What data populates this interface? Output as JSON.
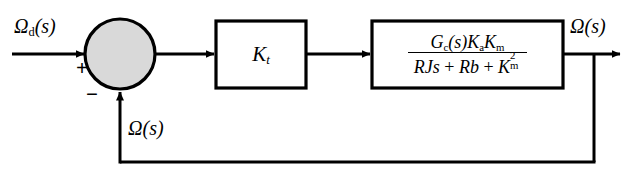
{
  "diagram": {
    "background_color": "#ffffff",
    "line_color": "#000000",
    "summing_junction_fill": "#d9d9d9"
  },
  "signals": {
    "input": {
      "name": "Omega_d(s)",
      "omega": "Ω",
      "subscript": "d",
      "arg": "(s)"
    },
    "output": {
      "name": "Omega(s)",
      "omega": "Ω",
      "arg": "(s)"
    },
    "feedback": {
      "name": "Omega(s)",
      "omega": "Ω",
      "arg": "(s)"
    }
  },
  "summing_junction": {
    "name": "summing-junction",
    "positive_sign": "+",
    "negative_sign": "−",
    "input_port_sign": "+",
    "feedback_port_sign": "−"
  },
  "blocks": [
    {
      "id": "gain",
      "label_main": "K",
      "label_sub": "t",
      "full_label": "K_t"
    },
    {
      "id": "transfer_function",
      "numerator": {
        "parts": [
          {
            "text": "G",
            "style": "italic"
          },
          {
            "text": "c",
            "style": "sub"
          },
          {
            "text": "(s)",
            "style": "italic"
          },
          {
            "text": "K",
            "style": "italic"
          },
          {
            "text": "a",
            "style": "sub"
          },
          {
            "text": "K",
            "style": "italic"
          },
          {
            "text": "m",
            "style": "sub"
          }
        ],
        "plain": "G_c(s)K_a K_m"
      },
      "denominator": {
        "parts": [
          {
            "text": "RJs",
            "style": "italic"
          },
          {
            "text": " + ",
            "style": "roman"
          },
          {
            "text": "Rb",
            "style": "italic"
          },
          {
            "text": " + ",
            "style": "roman"
          },
          {
            "text": "K",
            "style": "italic"
          },
          {
            "text": "m",
            "style": "sub"
          },
          {
            "text": "2",
            "style": "sup"
          }
        ],
        "plain": "RJs + Rb + K_m^2"
      },
      "full_label": "(G_c(s)K_a K_m) / (RJs + Rb + K_m^2)"
    }
  ],
  "text": {
    "num_G": "G",
    "num_c": "c",
    "num_s1": "(s)",
    "num_K1": "K",
    "num_a": "a",
    "num_K2": "K",
    "num_m1": "m",
    "den_RJs": "RJs",
    "den_plus1": "+",
    "den_Rb": "Rb",
    "den_plus2": "+",
    "den_K": "K",
    "den_m": "m",
    "den_sup2": "2",
    "gain_K": "K",
    "gain_t": "t",
    "omega": "Ω",
    "sub_d": "d",
    "paren_s": "(s)",
    "plus": "+",
    "minus": "−"
  }
}
